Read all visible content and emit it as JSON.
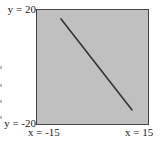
{
  "chart_data": {
    "type": "line",
    "title": "",
    "xlabel": "x",
    "ylabel": "y",
    "xlim": [
      -15,
      15
    ],
    "ylim": [
      -20,
      20
    ],
    "grid": false,
    "legend": null,
    "tick_labels": {
      "x_min": "x = -15",
      "x_max": "x = 15",
      "y_min": "y = -20",
      "y_max": "y = 20"
    },
    "series": [
      {
        "name": "line",
        "x": [
          -8.4,
          10.5
        ],
        "y": [
          16.6,
          -14.8
        ]
      }
    ],
    "colors": {
      "background": "#c0c0c0",
      "line": "#333333",
      "border": "#444444"
    }
  },
  "labels": {
    "y_max": "y = 20",
    "y_min": "y = -20",
    "x_min": "x = -15",
    "x_max": "x = 15"
  }
}
